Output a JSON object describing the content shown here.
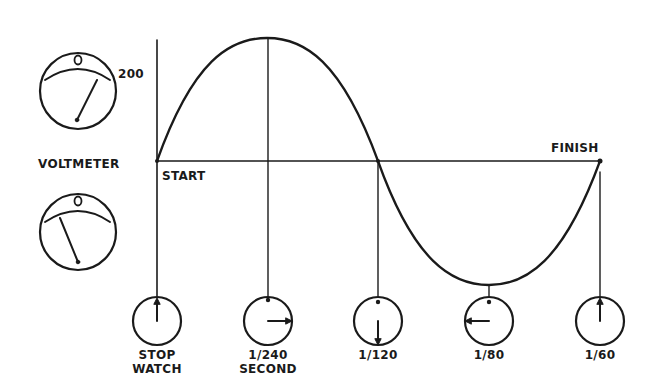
{
  "diagram": {
    "colors": {
      "ink": "#1a1a1a",
      "background": "#ffffff"
    },
    "voltmeter": {
      "label": "VOLTMETER",
      "top_meter": {
        "scale_label": "0",
        "reading_label": "200",
        "needle": "positive"
      },
      "bottom_meter": {
        "scale_label": "0",
        "needle": "negative"
      }
    },
    "wave": {
      "start_label": "START",
      "finish_label": "FINISH"
    },
    "stopwatches": [
      {
        "label_line1": "STOP",
        "label_line2": "WATCH",
        "hand": "up"
      },
      {
        "label_line1": "1/240",
        "label_line2": "SECOND",
        "hand": "right"
      },
      {
        "label_line1": "1/120",
        "label_line2": "",
        "hand": "down"
      },
      {
        "label_line1": "1/80",
        "label_line2": "",
        "hand": "left"
      },
      {
        "label_line1": "1/60",
        "label_line2": "",
        "hand": "up"
      }
    ]
  }
}
